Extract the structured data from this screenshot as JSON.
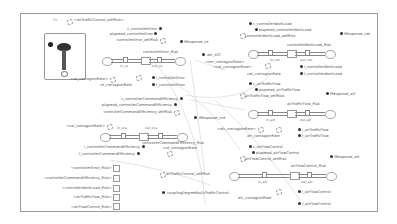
{
  "diagram": {
    "corner_tag": "Bo",
    "top_left": {
      "shadow": "<airTrafficControl_selfRisk>",
      "vars": [
        "c_controllerError",
        "plspread_controllerError",
        "controllerError_selfRisk"
      ],
      "stock_title": "controllerError_Risk",
      "flow_in": "in_ce",
      "flow_out": "out_ce",
      "shadow_contagion": "<ce_contagionRate>",
      "contagion": "ce_contagionRate",
      "params": [
        "i_controllerError",
        "f_controllerError"
      ],
      "response": "fResponse_ce"
    },
    "center": {
      "ser_atc": "ser_ATC",
      "shadow_ccr": "<cer_contagionRate>",
      "shadow_cal": "<cal_contagionRate>",
      "response_cce": "fResponse_cce",
      "coupling": "couplingDegreeBoAirTrafficControl",
      "atc_selfrisk": "airTrafficControl_selfRisk"
    },
    "mid_left": {
      "vars": [
        "c_controllerCommandEfficiency",
        "plspread_controllerCommandEfficiency",
        "controllerCommandEfficiency_selfRisk"
      ],
      "shadow_contagion": "<cal_contagionRate>",
      "flow_in": "in_cce",
      "flow_out": "out_cce",
      "stock_title": "controllerCommandEfficiency_Risk",
      "contagion": "cce_contagionRate",
      "params": [
        "i_controllerCommandEfficiency",
        "f_controllerCommandEfficiency"
      ]
    },
    "risk_boxes": [
      "<controllerError_Risk>",
      "<controllerCommandEfficiency_Risk>",
      "<controllerWorkLoad_Risk>",
      "<airTrafficFlow_Risk>",
      "<airFlowControl_Risk>"
    ],
    "top_right": {
      "vars": [
        "c_controllerWorkLoad",
        "plspread_controllerWorkLoad",
        "controllerWorkLoad_selfRisk"
      ],
      "response": "fResponse_cwl",
      "stock_title": "controllerWorkLoad_Risk",
      "flow_in": "in_cwl",
      "flow_out": "out_cwl",
      "contagion": "cwl_contagionRate",
      "params": [
        "i_controllerWorkLoad",
        "f_controllerWorkLoad"
      ]
    },
    "mid_right": {
      "vars": [
        "c_airTrafficFlow",
        "plspread_airTrafficFlow",
        "airTrafficFlow_selfRisk"
      ],
      "response": "fResponse_atf",
      "stock_title": "airTrafficFlow_Risk",
      "flow_in": "in_atf",
      "flow_out": "out_atf",
      "shadow_contagion": "<afc_contagionRate>",
      "contagion": "atf_contagionRate",
      "params": [
        "i_airTrafficFlow",
        "f_airTrafficFlow"
      ]
    },
    "bottom_right": {
      "vars": [
        "c_airFlowControl",
        "plspread_airFlowControl",
        "airFlowControl_selfRisk"
      ],
      "response": "fResponse_afc",
      "stock_title": "airFlowControl_Risk",
      "flow_in": "in_afc",
      "flow_out": "out_afc",
      "contagion": "afc_contagionRate",
      "params": [
        "i_airFlowControl",
        "f_airFlowControl"
      ]
    }
  }
}
